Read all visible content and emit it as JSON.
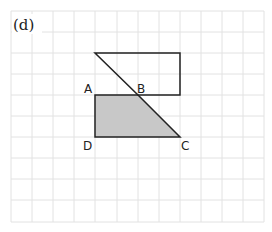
{
  "figure": {
    "label": "(d)",
    "grid": {
      "cols": 12,
      "rows": 10,
      "cell": 21.1,
      "origin_x": 11,
      "origin_y": 11,
      "line_color": "#e2e2e2"
    },
    "shapes": {
      "upper_outline": {
        "stroke": "#222222",
        "fill": "none"
      },
      "lower_shaded": {
        "stroke": "#222222",
        "fill": "#c8c8c8"
      }
    },
    "points": [
      {
        "name": "A",
        "label": "A"
      },
      {
        "name": "B",
        "label": "B"
      },
      {
        "name": "C",
        "label": "C"
      },
      {
        "name": "D",
        "label": "D"
      }
    ]
  }
}
